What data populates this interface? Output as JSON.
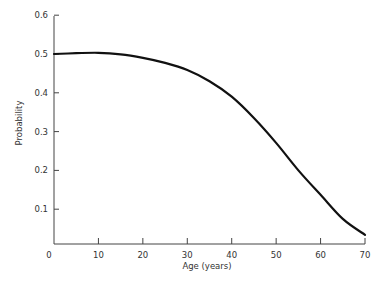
{
  "chart_data": {
    "type": "line",
    "title": "",
    "xlabel": "Age (years)",
    "ylabel": "Probability",
    "xlim": [
      0,
      70
    ],
    "ylim": [
      0,
      0.6
    ],
    "grid": false,
    "legend": null,
    "x_ticks": [
      0,
      10,
      20,
      30,
      40,
      50,
      60,
      70
    ],
    "x_tick_labels": [
      "0",
      "10",
      "20",
      "30",
      "40",
      "50",
      "60",
      "70"
    ],
    "y_ticks": [
      0.1,
      0.2,
      0.3,
      0.4,
      0.5,
      0.6
    ],
    "y_tick_labels": [
      "0.1",
      "0.2",
      "0.3",
      "0.4",
      "0.5",
      "0.6"
    ],
    "series": [
      {
        "name": "Probability",
        "x": [
          0,
          5,
          10,
          15,
          20,
          25,
          30,
          35,
          40,
          45,
          50,
          55,
          60,
          65,
          70
        ],
        "y": [
          0.5,
          0.502,
          0.503,
          0.499,
          0.49,
          0.477,
          0.459,
          0.43,
          0.39,
          0.335,
          0.271,
          0.2,
          0.137,
          0.075,
          0.034
        ]
      }
    ]
  }
}
